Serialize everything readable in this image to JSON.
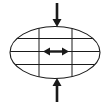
{
  "figure": {
    "title": "",
    "type": "mechanics-deformation-diagram",
    "background_color": "#ffffff",
    "stroke_color": "#1a1a1a",
    "fill_color": "#ffffff"
  },
  "ellipse": {
    "label": "ellipse-body",
    "center_x": 55,
    "center_y": 52.5,
    "radius_x": 45,
    "radius_y": 26,
    "stroke_width": 1.1,
    "fill": "#ffffff",
    "stroke": "#1a1a1a"
  },
  "grid": {
    "label": "internal-grid",
    "stroke_width": 1.0,
    "stroke": "#1a1a1a",
    "horizontal_lines_y": [
      38.5,
      51.5,
      64.5
    ],
    "vertical_lines_x": [
      39,
      72
    ]
  },
  "arrows": {
    "top": {
      "label": "compression-arrow-top",
      "direction": "down",
      "x": 57,
      "y_start": 3,
      "y_end": 27,
      "shaft_width": 2.6,
      "head_width": 9,
      "head_length": 8,
      "color": "#1a1a1a"
    },
    "bottom": {
      "label": "compression-arrow-bottom",
      "direction": "up",
      "x": 57,
      "y_start": 102,
      "y_end": 78,
      "shaft_width": 2.6,
      "head_width": 9,
      "head_length": 8,
      "color": "#1a1a1a"
    },
    "center": {
      "label": "expansion-arrow-center",
      "direction": "horizontal-double",
      "y": 51.5,
      "x_start": 43,
      "x_end": 69,
      "shaft_width": 2.4,
      "head_width": 8,
      "head_length": 7,
      "color": "#1a1a1a"
    }
  }
}
